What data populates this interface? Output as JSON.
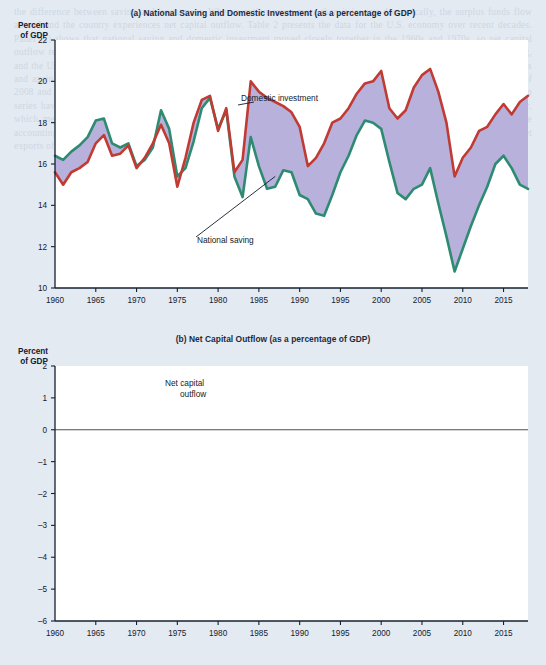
{
  "figure": {
    "background_color": "#e3eaf2",
    "plot_background": "#ffffff"
  },
  "bleed_text": "the difference between saving and investment. When a nation saves more than it invests domestically, the surplus funds flow abroad and the country experiences net capital outflow. Table 2 presents the data for the U.S. economy over recent decades. Panel (a) shows that national saving and domestic investment moved closely together in the 1960s and 1970s, so net capital outflow remained near zero. Beginning in the early 1980s, however, a substantial gap opened between investment and saving, and the United States became a net borrower from the rest of the world. The trade deficit widened sharply during the late 1990s and again in the mid-2000s, when net capital outflow reached almost negative 6 percent of GDP. After the financial crisis of 2008 and 2009, both saving and investment fell steeply, and the gap between them narrowed considerably. Since then the two series have recovered, but domestic investment continues to exceed national saving by roughly 3 percent of GDP each year, which means that foreigners continue to finance a sizable share of U.S. capital accumulation. These figures illustrate the accounting identity that net capital outflow always equals national saving minus domestic investment, and that it also equals net exports of goods and services.",
  "panel_a": {
    "label": "(a)",
    "title": "(a) National Saving and Domestic Investment (as a percentage of GDP)",
    "y_axis_title_line1": "Percent",
    "y_axis_title_line2": "of GDP",
    "annotations": [
      {
        "name": "domestic-investment-label",
        "text": "Domestic investment"
      },
      {
        "name": "national-saving-label",
        "text": "National saving"
      }
    ]
  },
  "panel_b": {
    "label": "(b)",
    "title": "(b) Net Capital Outflow (as a percentage of GDP)",
    "y_axis_title_line1": "Percent",
    "y_axis_title_line2": "of GDP",
    "annotations": [
      {
        "name": "net-capital-outflow-label",
        "text_line1": "Net capital",
        "text_line2": "outflow"
      }
    ]
  },
  "chart_data": [
    {
      "id": "panel-a",
      "type": "area",
      "title": "(a) National Saving and Domestic Investment (as a percentage of GDP)",
      "xlabel": "",
      "ylabel": "Percent of GDP",
      "xlim": [
        1960,
        2018
      ],
      "ylim": [
        10,
        22
      ],
      "yticks": [
        10,
        12,
        14,
        16,
        18,
        20,
        22
      ],
      "xticks": [
        1960,
        1965,
        1970,
        1975,
        1980,
        1985,
        1990,
        1995,
        2000,
        2005,
        2010,
        2015
      ],
      "grid": false,
      "legend": "annotated-inline",
      "fill_between_color": "#b3adda",
      "x": [
        1960,
        1961,
        1962,
        1963,
        1964,
        1965,
        1966,
        1967,
        1968,
        1969,
        1970,
        1971,
        1972,
        1973,
        1974,
        1975,
        1976,
        1977,
        1978,
        1979,
        1980,
        1981,
        1982,
        1983,
        1984,
        1985,
        1986,
        1987,
        1988,
        1989,
        1990,
        1991,
        1992,
        1993,
        1994,
        1995,
        1996,
        1997,
        1998,
        1999,
        2000,
        2001,
        2002,
        2003,
        2004,
        2005,
        2006,
        2007,
        2008,
        2009,
        2010,
        2011,
        2012,
        2013,
        2014,
        2015,
        2016,
        2017,
        2018
      ],
      "series": [
        {
          "name": "Domestic investment",
          "color": "#bf3b33",
          "values": [
            15.6,
            15.0,
            15.6,
            15.8,
            16.1,
            17.0,
            17.4,
            16.4,
            16.5,
            16.9,
            15.8,
            16.3,
            17.0,
            17.9,
            17.0,
            14.9,
            16.3,
            18.0,
            19.1,
            19.3,
            17.6,
            18.7,
            15.6,
            16.2,
            20.0,
            19.5,
            19.2,
            19.0,
            18.8,
            18.5,
            17.8,
            15.9,
            16.3,
            17.0,
            18.0,
            18.2,
            18.7,
            19.4,
            19.9,
            20.0,
            20.5,
            18.7,
            18.2,
            18.6,
            19.7,
            20.3,
            20.6,
            19.5,
            18.0,
            15.4,
            16.3,
            16.8,
            17.6,
            17.8,
            18.4,
            18.9,
            18.4,
            19.0,
            19.3
          ],
          "values_rounded_note": "read from axis gridlines, nearest 0.1 pct of GDP"
        },
        {
          "name": "National saving",
          "color": "#2e8b72",
          "values": [
            16.4,
            16.2,
            16.6,
            16.9,
            17.3,
            18.1,
            18.2,
            17.0,
            16.8,
            17.0,
            15.9,
            16.2,
            16.8,
            18.6,
            17.7,
            15.4,
            15.8,
            17.1,
            18.7,
            19.2,
            17.7,
            18.6,
            15.4,
            14.4,
            17.3,
            15.9,
            14.8,
            14.9,
            15.7,
            15.6,
            14.5,
            14.3,
            13.6,
            13.5,
            14.5,
            15.6,
            16.4,
            17.4,
            18.1,
            18.0,
            17.7,
            16.1,
            14.6,
            14.3,
            14.8,
            15.0,
            15.8,
            14.1,
            12.5,
            10.8,
            11.9,
            13.0,
            14.0,
            14.9,
            16.0,
            16.4,
            15.8,
            15.0,
            14.8
          ],
          "values_rounded_note": "read from axis gridlines, nearest 0.1 pct of GDP"
        }
      ]
    },
    {
      "id": "panel-b",
      "type": "line",
      "title": "(b) Net Capital Outflow (as a percentage of GDP)",
      "xlabel": "",
      "ylabel": "Percent of GDP",
      "xlim": [
        1960,
        2018
      ],
      "ylim": [
        -6,
        2
      ],
      "yticks": [
        -6,
        -5,
        -4,
        -3,
        -2,
        -1,
        0,
        1,
        2
      ],
      "xticks": [
        1960,
        1965,
        1970,
        1975,
        1980,
        1985,
        1990,
        1995,
        2000,
        2005,
        2010,
        2015
      ],
      "grid": false,
      "zero_line": 0,
      "legend": "annotated-inline",
      "series": [
        {
          "name": "Net capital outflow",
          "color": "#40629e",
          "values": [
            0.8,
            0.75,
            0.7,
            0.7,
            0.95,
            0.8,
            0.45,
            0.45,
            0.2,
            0.1,
            0.25,
            0.05,
            -0.25,
            0.55,
            0.25,
            1.0,
            0.05,
            -0.7,
            -0.7,
            -0.2,
            -0.05,
            -0.2,
            -0.3,
            -1.0,
            -2.3,
            -2.7,
            -2.75,
            -2.5,
            -2.0,
            -1.6,
            -1.2,
            -0.4,
            -0.65,
            -0.8,
            -0.95,
            -1.0,
            -1.2,
            -1.3,
            -2.0,
            -2.7,
            -3.4,
            -3.25,
            -3.75,
            -4.25,
            -4.8,
            -5.4,
            -5.75,
            -4.65,
            -4.2,
            -2.6,
            -2.85,
            -2.75,
            -2.6,
            -2.55,
            -2.7,
            -2.8,
            -2.75,
            -2.9,
            -3.0
          ],
          "values_rounded_note": "read from axis gridlines, nearest 0.05 pct of GDP"
        }
      ]
    }
  ]
}
